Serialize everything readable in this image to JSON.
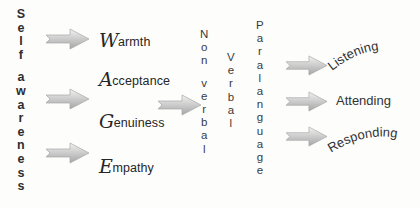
{
  "diagram": {
    "colors": {
      "background": "#fdfdfb",
      "text": "#333335",
      "arrow_light": "#e6e6e6",
      "arrow_mid": "#b9b9b9",
      "arrow_dark": "#9a9a9a"
    }
  },
  "self_awareness": {
    "label": "Self awareness",
    "lines": [
      "Self",
      "awareness"
    ]
  },
  "qualities": [
    {
      "cap": "W",
      "rest": "armth",
      "full": "Warmth"
    },
    {
      "cap": "A",
      "rest": "cceptance",
      "full": "Acceptance"
    },
    {
      "cap": "G",
      "rest": "enuiness",
      "full": "Genuiness"
    },
    {
      "cap": "E",
      "rest": "mpathy",
      "full": "Empathy"
    }
  ],
  "channels": [
    {
      "label": "Non verbal",
      "lines": [
        "Non",
        "verbal"
      ]
    },
    {
      "label": "Verbal",
      "lines": [
        "Verbal"
      ]
    },
    {
      "label": "Paralanguage",
      "lines": [
        "Paralanguage"
      ]
    }
  ],
  "skills": [
    {
      "label": "Listening",
      "shape": "arc-up"
    },
    {
      "label": "Attending",
      "shape": "flat"
    },
    {
      "label": "Responding",
      "shape": "arc-up"
    }
  ],
  "arrows": {
    "icon": "block-arrow-right-icon",
    "left_column_count": 3,
    "middle_count": 1,
    "right_column_count": 3
  }
}
